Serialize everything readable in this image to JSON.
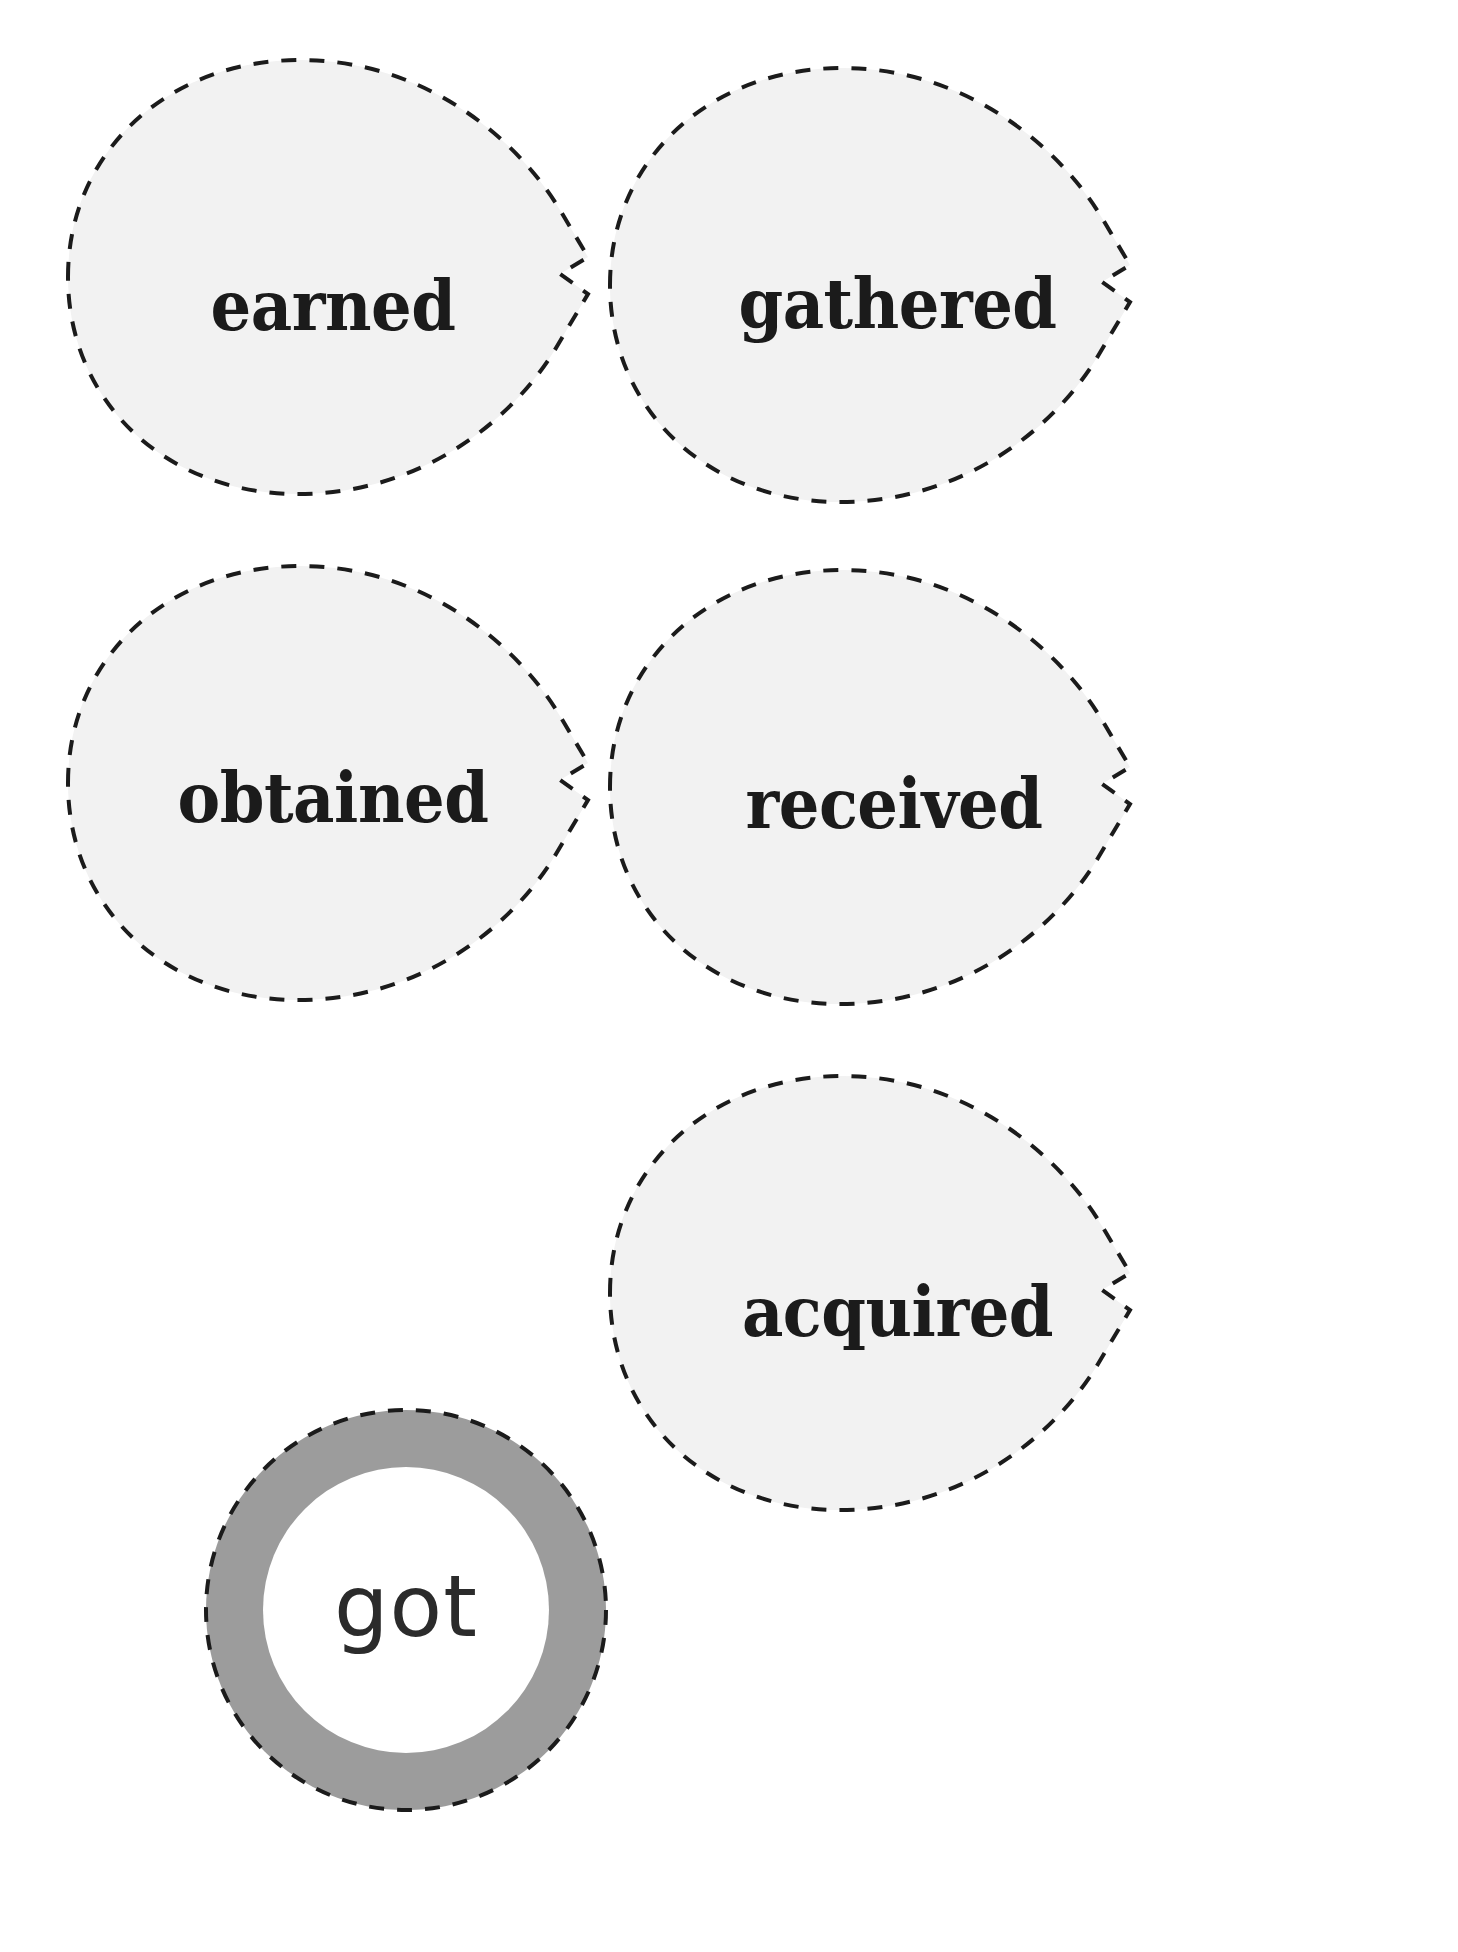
{
  "worksheet": {
    "title": "Synonyms for \"got\" — flower cut-out worksheet",
    "center_word": "got",
    "petal_fill": "#F2F2F2",
    "dash_color": "#1B1B1B",
    "ring_color": "#9C9C9C",
    "ring_inner_color": "#FFFFFF",
    "page_background": "#FFFFFF"
  },
  "pieces": [
    {
      "id": "petal-earned",
      "kind": "petal",
      "label": "earned",
      "row": 1,
      "column": 1
    },
    {
      "id": "petal-gathered",
      "kind": "petal",
      "label": "gathered",
      "row": 1,
      "column": 2
    },
    {
      "id": "petal-obtained",
      "kind": "petal",
      "label": "obtained",
      "row": 2,
      "column": 1
    },
    {
      "id": "petal-received",
      "kind": "petal",
      "label": "received",
      "row": 2,
      "column": 2
    },
    {
      "id": "circle-got",
      "kind": "circle",
      "label": "got",
      "row": 3,
      "column": 1
    },
    {
      "id": "petal-acquired",
      "kind": "petal",
      "label": "acquired",
      "row": 3,
      "column": 2
    }
  ]
}
